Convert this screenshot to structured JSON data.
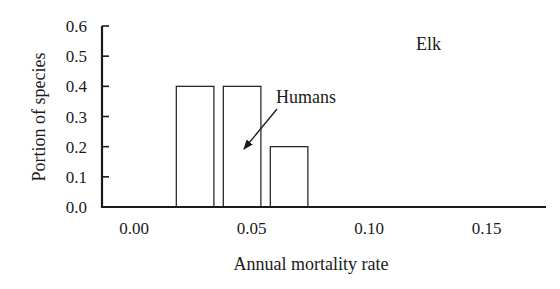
{
  "chart_data": {
    "type": "bar",
    "title": "",
    "panel_label": "Elk",
    "xlabel": "Annual mortality rate",
    "ylabel": "Portion of species",
    "xlim": [
      -0.014,
      0.175
    ],
    "ylim": [
      0.0,
      0.6
    ],
    "x_ticks": [
      "0.00",
      "0.05",
      "0.10",
      "0.15"
    ],
    "x_tick_values": [
      0.0,
      0.05,
      0.1,
      0.15
    ],
    "y_ticks": [
      "0.0",
      "0.1",
      "0.2",
      "0.3",
      "0.4",
      "0.5",
      "0.6"
    ],
    "y_tick_values": [
      0.0,
      0.1,
      0.2,
      0.3,
      0.4,
      0.5,
      0.6
    ],
    "grid": false,
    "legend": null,
    "bins": [
      {
        "x_start": 0.018,
        "x_end": 0.034,
        "value": 0.4
      },
      {
        "x_start": 0.038,
        "x_end": 0.054,
        "value": 0.4
      },
      {
        "x_start": 0.058,
        "x_end": 0.074,
        "value": 0.2
      }
    ],
    "categories": [
      "0.02-0.03",
      "0.04-0.05",
      "0.06-0.07"
    ],
    "values": [
      0.4,
      0.4,
      0.2
    ],
    "annotations": [
      {
        "text": "Humans",
        "arrow_to_bin": 1,
        "arrow_target": {
          "x": 0.045,
          "y": 0.2
        }
      }
    ]
  }
}
